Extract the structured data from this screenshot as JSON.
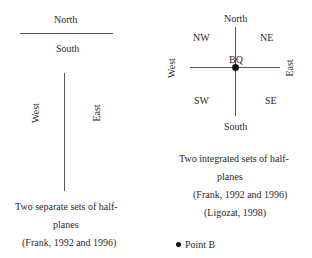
{
  "left_diagram": {
    "north": "North",
    "south": "South",
    "west": "West",
    "east": "East",
    "caption": {
      "line1": "Two separate sets of half-",
      "line2": "planes",
      "line3": "(Frank, 1992 and 1996)"
    }
  },
  "right_diagram": {
    "north": "North",
    "south": "South",
    "west": "West",
    "east": "East",
    "nw": "NW",
    "ne": "NE",
    "sw": "SW",
    "se": "SE",
    "center": "BQ",
    "caption": {
      "line1": "Two integrated sets of half-",
      "line2": "planes",
      "line3": "(Frank, 1992 and 1996)",
      "line4": "(Ligozat, 1998)"
    },
    "legend": {
      "point_label": "Point B"
    }
  }
}
